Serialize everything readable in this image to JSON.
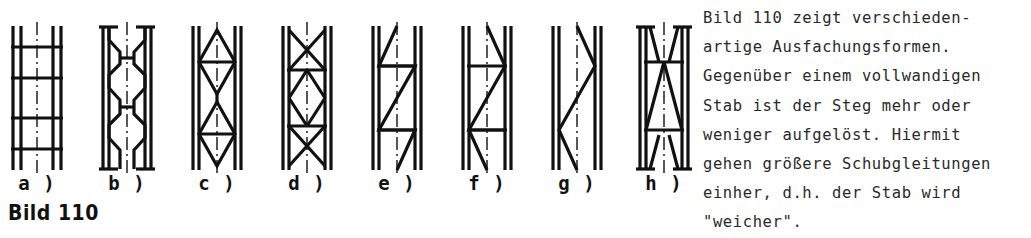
{
  "figure": {
    "caption": "Bild 110",
    "ink_color": "#111111",
    "background_color": "#ffffff",
    "centerline_style": "dash-dot",
    "diagrams": [
      {
        "label": "a )",
        "name": "battened",
        "description": "Battened column: two chords joined by horizontal batten plates"
      },
      {
        "label": "b )",
        "name": "perforated-web",
        "description": "Solid web with hexagonal perforations"
      },
      {
        "label": "c )",
        "name": "rhombic-lattice",
        "description": "Rhombic (diamond) lattice with horizontal struts"
      },
      {
        "label": "d )",
        "name": "cross-bracing",
        "description": "X cross bracing with horizontal struts"
      },
      {
        "label": "e )",
        "name": "zigzag-with-horizontals",
        "description": "Z shaped diagonal lacing with horizontal struts"
      },
      {
        "label": "f )",
        "name": "mirrored-zigzag-with-horizontals",
        "description": "Mirrored Z shaped diagonal lacing with horizontal struts"
      },
      {
        "label": "g )",
        "name": "zigzag-only",
        "description": "Diagonal zigzag lacing without horizontal struts"
      },
      {
        "label": "h )",
        "name": "tapered-web-plates",
        "description": "Tapered triangular web plates"
      }
    ]
  },
  "text": {
    "lines": [
      "Bild 110 zeigt verschieden-",
      "artige Ausfachungsformen.",
      "Gegenüber einem vollwandigen",
      "Stab ist der Steg mehr oder",
      "weniger aufgelöst. Hiermit",
      "gehen größere Schubgleitungen",
      "einher, d.h. der Stab wird",
      "\"weicher\"."
    ]
  }
}
